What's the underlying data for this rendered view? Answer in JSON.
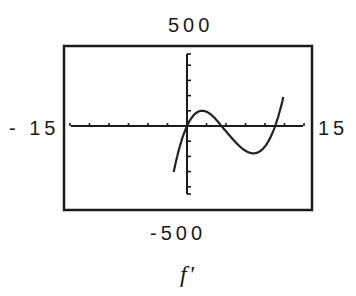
{
  "chart_data": {
    "type": "line",
    "title": "f'",
    "xlabel": "",
    "ylabel": "",
    "window": {
      "xmin": -15,
      "xmax": 15,
      "ymin": -500,
      "ymax": 500
    },
    "xlim": [
      -15,
      15
    ],
    "ylim": [
      -500,
      500
    ],
    "x_tick_step": 2.5,
    "y_tick_step": 100,
    "grid": false,
    "legend": null,
    "window_labels": {
      "xmin": "- 1 5",
      "xmax": "1 5",
      "ymin": "-5 0 0",
      "ymax": "5 0 0"
    },
    "series": [
      {
        "name": "f'",
        "description": "cubic-shaped derivative curve with zeros near x=0, x≈4.4, x≈11.3; local max ≈100 at x≈2, local min ≈-180 at x≈8.5",
        "x": [
          -1.7,
          -1,
          0,
          1,
          2,
          3,
          4.4,
          6,
          7,
          8.5,
          10,
          11.3,
          12.3
        ],
        "y": [
          -500,
          -260,
          0,
          85,
          100,
          75,
          0,
          -120,
          -165,
          -180,
          -110,
          0,
          500
        ]
      }
    ],
    "zeros": [
      0,
      4.4,
      11.3
    ],
    "local_max": {
      "x": 2,
      "y": 100
    },
    "local_min": {
      "x": 8.5,
      "y": -180
    }
  },
  "labels": {
    "ymax": "500",
    "ymin": "-500",
    "xmin": "- 15",
    "xmax": "15",
    "title": "f'"
  },
  "colors": {
    "frame": "#1a1a1a",
    "curve": "#222222",
    "axes": "#1a1a1a",
    "background": "#ffffff"
  }
}
